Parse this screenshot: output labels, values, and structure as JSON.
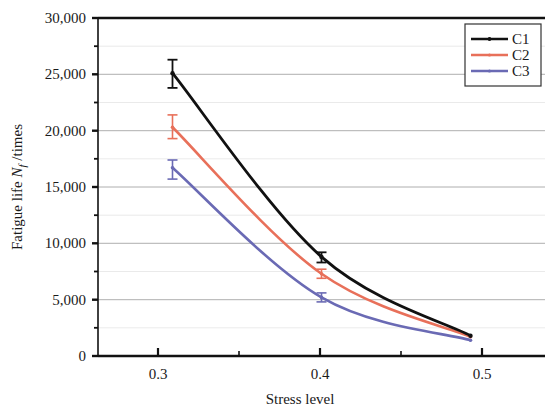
{
  "chart_data": {
    "type": "line",
    "title": "",
    "xlabel": "Stress level",
    "ylabel": "Fatigue life N_f /times",
    "ylabel_parts": {
      "prefix": "Fatigue life ",
      "symbol": "N",
      "subscript": "f",
      "suffix": " /times"
    },
    "x": [
      0.3,
      0.4,
      0.5
    ],
    "xlim": [
      0.25,
      0.55
    ],
    "ylim": [
      0,
      30000
    ],
    "xticks": [
      0.3,
      0.4,
      0.5
    ],
    "xticklabels": [
      "0.3",
      "0.4",
      "0.5"
    ],
    "xminorticks": [
      0.35,
      0.45
    ],
    "yticks": [
      0,
      5000,
      10000,
      15000,
      20000,
      25000,
      30000
    ],
    "yticklabels": [
      "0",
      "5,000",
      "10,000",
      "15,000",
      "20,000",
      "25,000",
      "30,000"
    ],
    "yminorticks": [
      2500,
      7500,
      12500,
      17500,
      22500,
      27500
    ],
    "grid": "horizontal-major",
    "legend_position": "top-right",
    "series": [
      {
        "name": "C1",
        "color": "#111111",
        "marker": "dot",
        "values": [
          25100,
          8800,
          1800
        ],
        "err_low": [
          23800,
          8300,
          1700
        ],
        "err_high": [
          26300,
          9200,
          1900
        ]
      },
      {
        "name": "C2",
        "color": "#e8705a",
        "marker": "dot",
        "values": [
          20300,
          7300,
          1700
        ],
        "err_low": [
          19300,
          6900,
          1600
        ],
        "err_high": [
          21400,
          7700,
          1800
        ]
      },
      {
        "name": "C3",
        "color": "#6a6ab4",
        "marker": "dot",
        "values": [
          16700,
          5200,
          1400
        ],
        "err_low": [
          15700,
          4800,
          1300
        ],
        "err_high": [
          17400,
          5600,
          1500
        ]
      }
    ]
  },
  "legend": {
    "items": [
      {
        "label": "C1"
      },
      {
        "label": "C2"
      },
      {
        "label": "C3"
      }
    ]
  },
  "axes": {
    "x_title": "Stress level",
    "y_title_prefix": "Fatigue life ",
    "y_title_symbol": "N",
    "y_title_sub": "f",
    "y_title_suffix": " /times"
  }
}
